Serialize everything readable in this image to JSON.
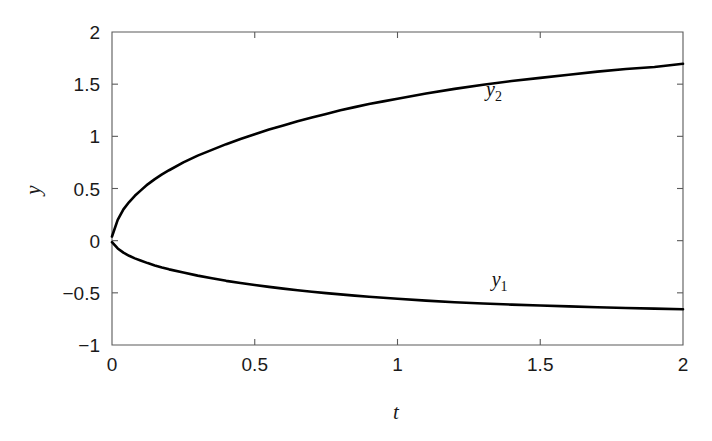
{
  "chart_data": {
    "type": "line",
    "title": "",
    "subtitle": "",
    "xlabel": "t",
    "ylabel": "y",
    "xlim": [
      0,
      2
    ],
    "ylim": [
      -1,
      2
    ],
    "grid": false,
    "legend_position": "inline-annotation",
    "x_ticks": [
      0,
      0.5,
      1,
      1.5,
      2
    ],
    "x_tick_labels": [
      "0",
      "0.5",
      "1",
      "1.5",
      "2"
    ],
    "y_ticks": [
      -1,
      -0.5,
      0,
      0.5,
      1,
      1.5,
      2
    ],
    "y_tick_labels": [
      "−1",
      "−0.5",
      "0",
      "0.5",
      "1",
      "1.5",
      "2"
    ],
    "annotations": [
      {
        "text": "y",
        "sub": "2",
        "x": 1.31,
        "y": 1.385
      },
      {
        "text": "y",
        "sub": "1",
        "x": 1.33,
        "y": -0.435
      }
    ],
    "x": [
      0,
      0.02,
      0.04,
      0.06,
      0.08,
      0.1,
      0.125,
      0.15,
      0.175,
      0.2,
      0.25,
      0.3,
      0.35,
      0.4,
      0.45,
      0.5,
      0.55,
      0.6,
      0.65,
      0.7,
      0.75,
      0.8,
      0.85,
      0.9,
      0.95,
      1.0,
      1.1,
      1.2,
      1.3,
      1.4,
      1.5,
      1.6,
      1.7,
      1.8,
      1.9,
      2.0
    ],
    "series": [
      {
        "name": "y2",
        "label": "y₂",
        "color": "#000000",
        "values": [
          0.04,
          0.2,
          0.3,
          0.37,
          0.43,
          0.48,
          0.54,
          0.59,
          0.635,
          0.675,
          0.75,
          0.815,
          0.87,
          0.925,
          0.975,
          1.02,
          1.065,
          1.105,
          1.145,
          1.18,
          1.215,
          1.25,
          1.28,
          1.31,
          1.335,
          1.36,
          1.41,
          1.455,
          1.495,
          1.53,
          1.56,
          1.59,
          1.62,
          1.645,
          1.665,
          1.695
        ]
      },
      {
        "name": "y1",
        "label": "y₁",
        "color": "#000000",
        "values": [
          -0.015,
          -0.075,
          -0.115,
          -0.145,
          -0.17,
          -0.19,
          -0.215,
          -0.237,
          -0.257,
          -0.275,
          -0.305,
          -0.335,
          -0.36,
          -0.385,
          -0.405,
          -0.425,
          -0.443,
          -0.46,
          -0.475,
          -0.49,
          -0.503,
          -0.515,
          -0.527,
          -0.537,
          -0.547,
          -0.556,
          -0.575,
          -0.59,
          -0.602,
          -0.613,
          -0.622,
          -0.63,
          -0.638,
          -0.645,
          -0.651,
          -0.657
        ]
      }
    ]
  },
  "axes": {
    "plot_left_px": 112,
    "plot_right_px": 683,
    "plot_top_px": 32,
    "plot_bottom_px": 345
  }
}
